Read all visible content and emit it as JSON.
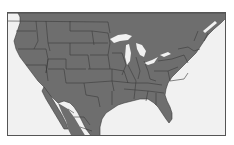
{
  "map": {
    "region": "United States (contiguous) with northern Mexico and southern Canada",
    "colors": {
      "land": "#6e6e6e",
      "borders": "#3a3a3a",
      "water": "#f1f1f1",
      "lakes": "#f1f1f1",
      "frame": "#555555",
      "background": "#ffffff"
    },
    "features": [
      "state-borders",
      "great-lakes",
      "gulf-of-mexico",
      "baja-california",
      "florida-peninsula"
    ]
  }
}
